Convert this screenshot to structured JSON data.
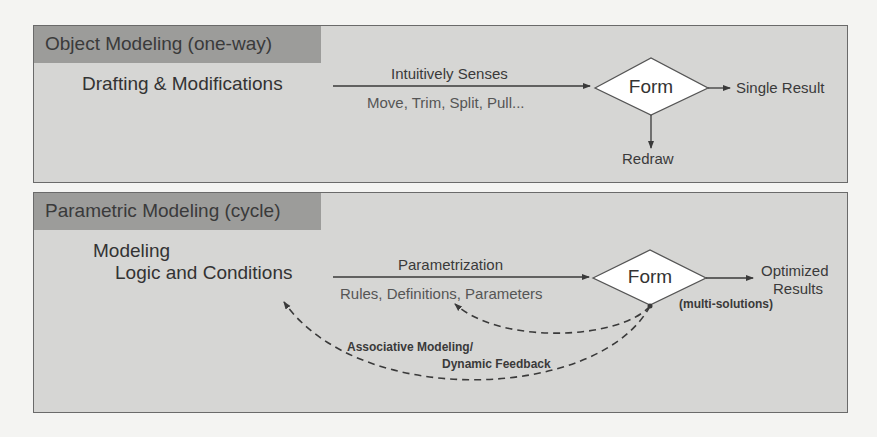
{
  "panels": {
    "object": {
      "header": "Object Modeling (one-way)",
      "source": "Drafting & Modifications",
      "arrow_top_label": "Intuitively Senses",
      "arrow_bottom_label": "Move, Trim, Split, Pull...",
      "node": "Form",
      "output": "Single Result",
      "down_output": "Redraw"
    },
    "parametric": {
      "header": "Parametric Modeling (cycle)",
      "source_line1": "Modeling",
      "source_line2": "Logic and Conditions",
      "arrow_top_label": "Parametrization",
      "arrow_bottom_label": "Rules, Definitions, Parameters",
      "node": "Form",
      "output_line1": "Optimized",
      "output_line2": "Results",
      "node_note": "(multi-solutions)",
      "feedback_line1": "Associative Modeling/",
      "feedback_line2": "Dynamic Feedback"
    }
  },
  "colors": {
    "page_background": "#f4f4f2",
    "panel_background": "#d6d6d4",
    "header_background": "#9c9c9a",
    "diamond_fill": "#ffffff",
    "line": "#3a3a3a"
  }
}
